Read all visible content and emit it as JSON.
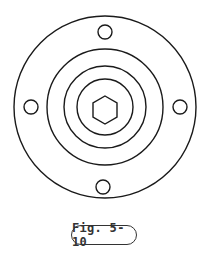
{
  "figure": {
    "caption": "Fig. 5-10",
    "stroke_color": "#1a1a1a",
    "center": [
      105,
      106
    ],
    "outer_circle_radius": 91,
    "ring_radii": [
      58,
      41,
      28
    ],
    "bolt_holes": [
      {
        "position": "top",
        "cx": 105,
        "cy": 32,
        "r": 7
      },
      {
        "position": "left",
        "cx": 31,
        "cy": 107,
        "r": 7
      },
      {
        "position": "right",
        "cx": 180,
        "cy": 107,
        "r": 7
      },
      {
        "position": "bottom",
        "cx": 103,
        "cy": 187,
        "r": 7
      }
    ],
    "hexagon_radius": 14
  }
}
